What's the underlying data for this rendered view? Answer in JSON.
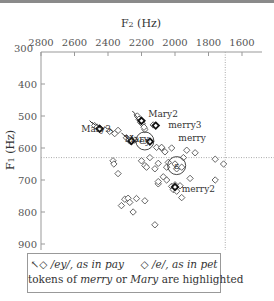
{
  "chart_data": {
    "type": "scatter",
    "title": "",
    "xlabel": "F2 (Hz)",
    "ylabel": "F1 (Hz)",
    "x_axis_position": "top",
    "x_reversed": true,
    "y_reversed": true,
    "xlim": [
      2800,
      1550
    ],
    "ylim": [
      300,
      930
    ],
    "x_ticks": [
      2800,
      2600,
      2400,
      2200,
      2000,
      1800,
      1600
    ],
    "y_ticks": [
      300,
      400,
      500,
      600,
      700,
      800,
      900
    ],
    "reference_lines": {
      "vertical_F2": 1700,
      "horizontal_F1": 630,
      "style": "dotted"
    },
    "grid": false,
    "series": [
      {
        "name": "/ey/, as in pay",
        "marker": "diamond-with-tail",
        "points": [
          [
            2480,
            530
          ],
          [
            2465,
            535
          ],
          [
            2445,
            540
          ],
          [
            2290,
            568
          ],
          [
            2275,
            575
          ],
          [
            2265,
            580
          ],
          [
            2240,
            575
          ],
          [
            2225,
            500
          ],
          [
            2215,
            510
          ],
          [
            2205,
            520
          ],
          [
            2195,
            525
          ],
          [
            2185,
            535
          ],
          [
            2390,
            548
          ],
          [
            2360,
            555
          ]
        ]
      },
      {
        "name": "/e/, as in pet",
        "marker": "diamond",
        "points": [
          [
            2340,
            545
          ],
          [
            2180,
            542
          ],
          [
            2130,
            528
          ],
          [
            2020,
            600
          ],
          [
            2080,
            600
          ],
          [
            2060,
            612
          ],
          [
            1930,
            607
          ],
          [
            1880,
            615
          ],
          [
            2120,
            665
          ],
          [
            2100,
            648
          ],
          [
            2050,
            660
          ],
          [
            2040,
            645
          ],
          [
            2200,
            640
          ],
          [
            2180,
            655
          ],
          [
            2170,
            660
          ],
          [
            2000,
            650
          ],
          [
            1990,
            665
          ],
          [
            1960,
            660
          ],
          [
            1760,
            635
          ],
          [
            2370,
            640
          ],
          [
            2365,
            650
          ],
          [
            2340,
            680
          ],
          [
            2020,
            720
          ],
          [
            2010,
            730
          ],
          [
            1990,
            735
          ],
          [
            1970,
            718
          ],
          [
            2050,
            700
          ],
          [
            2070,
            690
          ],
          [
            2100,
            712
          ],
          [
            1910,
            695
          ],
          [
            1960,
            755
          ],
          [
            2300,
            760
          ],
          [
            2280,
            757
          ],
          [
            2270,
            770
          ],
          [
            2230,
            758
          ],
          [
            2180,
            765
          ],
          [
            2100,
            705
          ],
          [
            2000,
            715
          ],
          [
            1710,
            650
          ],
          [
            1760,
            700
          ],
          [
            2250,
            800
          ],
          [
            2320,
            780
          ],
          [
            2120,
            840
          ],
          [
            2150,
            630
          ],
          [
            1950,
            630
          ],
          [
            2110,
            598
          ],
          [
            2080,
            598
          ]
        ]
      }
    ],
    "annotations": [
      {
        "text": "Mary2",
        "F2": 2160,
        "F1": 495
      },
      {
        "text": "merry3",
        "F2": 2040,
        "F1": 528
      },
      {
        "text": "Mary3",
        "F2": 2560,
        "F1": 540
      },
      {
        "text": "Mary",
        "F2": 2300,
        "F1": 572
      },
      {
        "text": "merry",
        "F2": 1980,
        "F1": 570
      },
      {
        "text": "merry2",
        "F2": 1960,
        "F1": 728
      },
      {
        "text": "ey",
        "F2": 2180,
        "F1": 578,
        "style": "circled-mean"
      },
      {
        "text": "ɛ",
        "F2": 1990,
        "F1": 655,
        "style": "circled-mean"
      }
    ],
    "highlighted": {
      "Mary": [
        2260,
        578
      ],
      "Mary2": [
        2200,
        515
      ],
      "Mary3": [
        2450,
        540
      ],
      "merry": [
        2150,
        580
      ],
      "merry2": [
        2000,
        722
      ],
      "merry3": [
        2115,
        530
      ]
    },
    "legend": {
      "position": "bottom",
      "entries": [
        {
          "symbol": "diamond-with-tail",
          "label": "/ey/, as in pay"
        },
        {
          "symbol": "diamond",
          "label": "/e/, as in pet"
        }
      ],
      "note": "tokens of merry or Mary are highlighted"
    }
  },
  "labels": {
    "xlabel": "F",
    "xlabel_sub": "2",
    "xlabel_unit": " (Hz)",
    "ylabel": "F",
    "ylabel_sub": "1",
    "ylabel_unit": " (Hz)"
  },
  "legend": {
    "ey_prefix": "/ey/, as in ",
    "ey_word": "pay",
    "e_prefix": "/e/, as in ",
    "e_word": "pet",
    "note_pre": "tokens of ",
    "note_w1": "merry",
    "note_mid": " or ",
    "note_w2": "Mary",
    "note_post": " are highlighted"
  }
}
